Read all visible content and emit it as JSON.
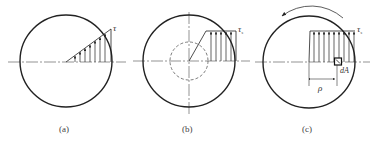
{
  "figure": {
    "stroke_color": "#222222",
    "axis_color": "#555555",
    "panels": [
      {
        "id": "a",
        "caption": "(a)",
        "stress_label": "τ",
        "stress_subscript": "",
        "description": "Linear shear stress distribution over solid circular cross-section"
      },
      {
        "id": "b",
        "caption": "(b)",
        "stress_label": "τ",
        "stress_subscript": "s",
        "description": "Elastic-plastic distribution with elastic core (dashed circle) and plastic outer zone"
      },
      {
        "id": "c",
        "caption": "(c)",
        "stress_label": "τ",
        "stress_subscript": "s",
        "area_label": "dA",
        "radius_label": "ρ",
        "description": "Fully plastic uniform shear stress distribution with torque direction arrow"
      }
    ]
  }
}
